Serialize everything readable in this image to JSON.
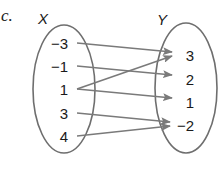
{
  "problem": {
    "part_label": "c."
  },
  "domain_set": {
    "name": "X",
    "elements": [
      "−3",
      "−1",
      "1",
      "3",
      "4"
    ]
  },
  "range_set": {
    "name": "Y",
    "elements": [
      "3",
      "2",
      "1",
      "−2"
    ]
  },
  "mapping": [
    {
      "from": "−3",
      "to": "3"
    },
    {
      "from": "−1",
      "to": "2"
    },
    {
      "from": "1",
      "to": "3"
    },
    {
      "from": "1",
      "to": "1"
    },
    {
      "from": "3",
      "to": "−2"
    },
    {
      "from": "4",
      "to": "−2"
    }
  ],
  "colors": {
    "ellipse_stroke": "#6e6e6e",
    "arrow": "#7a7a7a",
    "text": "#1a1a1a"
  }
}
